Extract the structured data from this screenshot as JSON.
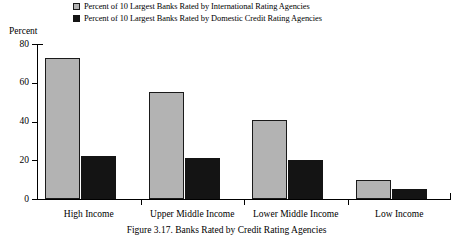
{
  "chart_data": {
    "type": "bar",
    "title": "",
    "xlabel": "",
    "ylabel": "Percent",
    "ylim": [
      0,
      80
    ],
    "yticks": [
      0,
      20,
      40,
      60,
      80
    ],
    "grid": false,
    "legend_position": "top",
    "categories": [
      "High Income",
      "Upper Middle Income",
      "Lower Middle Income",
      "Low Income"
    ],
    "series": [
      {
        "name": "Percent of 10 Largest Banks Rated by International Rating Agencies",
        "color": "#b3b3b3",
        "values": [
          73,
          55,
          41,
          10
        ]
      },
      {
        "name": "Percent of 10 Largest Banks Rated by Domestic Credit Rating Agencies",
        "color": "#141414",
        "values": [
          22,
          21,
          20,
          5
        ]
      }
    ]
  },
  "axis": {
    "unit_label": "Percent",
    "ytick_labels": [
      "0",
      "20",
      "40",
      "60",
      "80"
    ]
  },
  "legend": {
    "items": [
      {
        "label": "Percent of 10 Largest Banks Rated by International Rating Agencies"
      },
      {
        "label": "Percent of 10 Largest Banks Rated by Domestic Credit Rating Agencies"
      }
    ]
  },
  "caption": {
    "text": "Figure 3.17. Banks Rated by Credit Rating Agencies"
  }
}
